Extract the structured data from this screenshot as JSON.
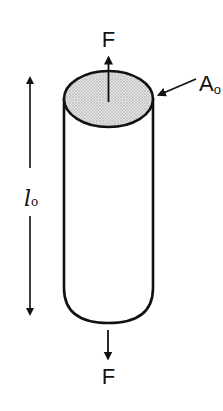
{
  "diagram": {
    "labels": {
      "force_top": "F",
      "force_bottom": "F",
      "area": "A",
      "area_subscript": "o",
      "length": "l",
      "length_subscript": "o"
    },
    "colors": {
      "stroke": "#111111",
      "top_face_fill": "#d6d6d6",
      "background": "#ffffff"
    }
  }
}
